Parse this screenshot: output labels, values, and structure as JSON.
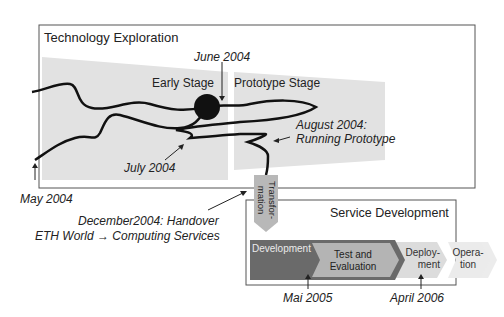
{
  "diagram": {
    "tech_box": {
      "title": "Technology Exploration"
    },
    "stages": {
      "early": "Early Stage",
      "prototype": "Prototype Stage"
    },
    "annotations": {
      "june": "June 2004",
      "august_line1": "August 2004:",
      "august_line2": "Running Prototype",
      "july": "July 2004",
      "may": "May 2004",
      "december_line1": "December2004: Handover",
      "december_line2": "ETH World → Computing Services",
      "mai2005": "Mai 2005",
      "april2006": "April 2006"
    },
    "transformation": {
      "line1": "Transfor-",
      "line2": "mation"
    },
    "service_box": {
      "title": "Service Development"
    },
    "phases": [
      {
        "label": "Development",
        "color": "#6e6e6e"
      },
      {
        "label_line1": "Test and",
        "label_line2": "Evaluation",
        "color": "#b4b4b4"
      },
      {
        "label_line1": "Deploy-",
        "label_line2": "ment",
        "color": "#d8d8d8"
      },
      {
        "label_line1": "Opera-",
        "label_line2": "tion",
        "color": "#e6e6e6"
      }
    ],
    "colors": {
      "stage_fill": "#e2e2e2",
      "border": "#555555",
      "path": "#111111"
    }
  }
}
